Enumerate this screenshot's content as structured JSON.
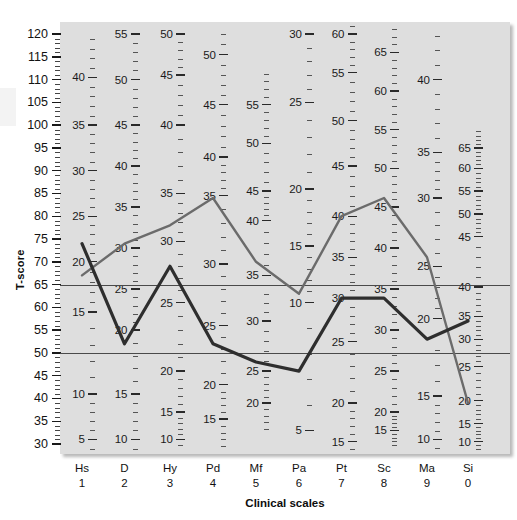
{
  "chart_data": {
    "type": "line",
    "title": "",
    "xlabel": "Clinical scales",
    "ylabel": "T-score",
    "ylim": [
      30,
      120
    ],
    "ytick_values": [
      120,
      115,
      110,
      105,
      100,
      95,
      90,
      85,
      80,
      75,
      70,
      65,
      60,
      55,
      50,
      45,
      40,
      35,
      30
    ],
    "grid": false,
    "legend": "none",
    "categories": [
      "Hs",
      "D",
      "Hy",
      "Pd",
      "Mf",
      "Pa",
      "Pt",
      "Sc",
      "Ma",
      "Si"
    ],
    "category_numbers": [
      "1",
      "2",
      "3",
      "4",
      "5",
      "6",
      "7",
      "8",
      "9",
      "0"
    ],
    "reference_lines": [
      {
        "value": 65,
        "label": "65"
      },
      {
        "value": 50,
        "label": "50"
      }
    ],
    "series": [
      {
        "name": "profile-gray",
        "color": "#6b6b6b",
        "values": [
          67,
          74,
          78,
          84,
          70,
          63,
          80,
          84,
          71,
          39
        ]
      },
      {
        "name": "profile-dark",
        "color": "#2e2e2e",
        "values": [
          74,
          52,
          69,
          52,
          48,
          46,
          62,
          62,
          53,
          57
        ]
      }
    ],
    "raw_score_columns": [
      {
        "scale": "Hs",
        "labels": [
          "40",
          "35",
          "30",
          "25",
          "20",
          "15",
          "10",
          "5"
        ],
        "t_at_label": [
          110.5,
          100.0,
          90.0,
          80.0,
          70.0,
          59.0,
          41.0,
          31.0
        ]
      },
      {
        "scale": "D",
        "labels": [
          "55",
          "50",
          "45",
          "40",
          "35",
          "30",
          "25",
          "20",
          "15",
          "10"
        ],
        "t_at_label": [
          120.0,
          110.0,
          100.0,
          91.0,
          82.0,
          73.0,
          64.0,
          55.0,
          41.0,
          31.0
        ]
      },
      {
        "scale": "Hy",
        "labels": [
          "50",
          "45",
          "40",
          "35",
          "30",
          "25",
          "20",
          "15",
          "10"
        ],
        "t_at_label": [
          120.0,
          111.0,
          100.0,
          85.0,
          74.5,
          61.0,
          46.0,
          37.0,
          31.0
        ]
      },
      {
        "scale": "Pd",
        "labels": [
          "50",
          "45",
          "40",
          "35",
          "30",
          "25",
          "20",
          "15"
        ],
        "t_at_label": [
          115.5,
          104.5,
          93.0,
          84.5,
          69.5,
          56.0,
          43.0,
          35.5
        ]
      },
      {
        "scale": "Mf",
        "labels": [
          "55",
          "50",
          "45",
          "40",
          "35",
          "30",
          "25",
          "20"
        ],
        "t_at_label": [
          104.5,
          96.0,
          85.5,
          79.0,
          67.0,
          57.0,
          46.0,
          39.0
        ]
      },
      {
        "scale": "Pa",
        "labels": [
          "30",
          "25",
          "20",
          "15",
          "10",
          "5"
        ],
        "t_at_label": [
          120.0,
          105.0,
          86.0,
          73.5,
          61.0,
          33.0
        ]
      },
      {
        "scale": "Pt",
        "labels": [
          "60",
          "55",
          "50",
          "45",
          "40",
          "35",
          "30",
          "25",
          "20",
          "15"
        ],
        "t_at_label": [
          120.0,
          111.5,
          101.0,
          91.0,
          80.0,
          71.0,
          62.0,
          52.5,
          39.0,
          30.5
        ]
      },
      {
        "scale": "Sc",
        "labels": [
          "65",
          "60",
          "55",
          "50",
          "45",
          "40",
          "35",
          "30",
          "25",
          "20",
          "15"
        ],
        "t_at_label": [
          116.0,
          107.5,
          99.0,
          90.5,
          82.0,
          73.0,
          64.0,
          55.0,
          46.0,
          37.0,
          33.0
        ]
      },
      {
        "scale": "Ma",
        "labels": [
          "40",
          "35",
          "30",
          "25",
          "20",
          "15",
          "10"
        ],
        "t_at_label": [
          110.0,
          94.0,
          84.0,
          69.0,
          57.5,
          40.5,
          31.0
        ]
      },
      {
        "scale": "Si",
        "labels": [
          "65",
          "60",
          "55",
          "50",
          "45",
          "40",
          "35",
          "30",
          "25",
          "20",
          "15",
          "10"
        ],
        "t_at_label": [
          95.0,
          90.5,
          85.5,
          80.5,
          75.5,
          64.5,
          58.0,
          53.0,
          47.0,
          39.5,
          34.5,
          30.5
        ]
      }
    ]
  },
  "axis": {
    "y_title": "T-score",
    "x_title": "Clinical scales"
  }
}
